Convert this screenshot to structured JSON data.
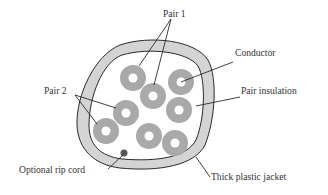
{
  "diagram": {
    "labels": {
      "pair1": "Pair 1",
      "pair2": "Pair 2",
      "conductor": "Conductor",
      "pair_insulation": "Pair insulation",
      "rip_cord": "Optional rip cord",
      "jacket": "Thick plastic jacket"
    },
    "colors": {
      "jacket_fill": "#d4d4d4",
      "insulation_fill": "#a9a9a9",
      "outline": "#2a2a2a",
      "rip_cord": "#555555",
      "text": "#333333"
    }
  }
}
